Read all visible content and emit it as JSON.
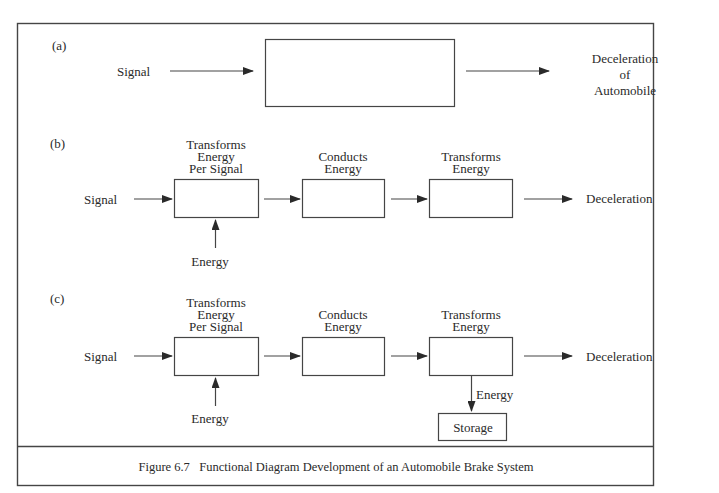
{
  "figure": {
    "caption": "Figure 6.7   Functional Diagram Development of an Automobile Brake System",
    "line_color": "#444444",
    "text_color": "#2a2a2a"
  },
  "panel_a": {
    "label": "(a)",
    "input": "Signal",
    "output_line1": "Deceleration",
    "output_line2": "of",
    "output_line3": "Automobile"
  },
  "panel_b": {
    "label": "(b)",
    "input": "Signal",
    "blocks": [
      {
        "line1": "Transforms",
        "line2": "Energy",
        "line3": "Per Signal"
      },
      {
        "line1": "Conducts",
        "line2": "Energy"
      },
      {
        "line1": "Transforms",
        "line2": "Energy"
      }
    ],
    "energy_input": "Energy",
    "output": "Deceleration"
  },
  "panel_c": {
    "label": "(c)",
    "input": "Signal",
    "blocks": [
      {
        "line1": "Transforms",
        "line2": "Energy",
        "line3": "Per Signal"
      },
      {
        "line1": "Conducts",
        "line2": "Energy"
      },
      {
        "line1": "Transforms",
        "line2": "Energy"
      }
    ],
    "energy_input": "Energy",
    "energy_output": "Energy",
    "storage": "Storage",
    "output": "Deceleration"
  }
}
